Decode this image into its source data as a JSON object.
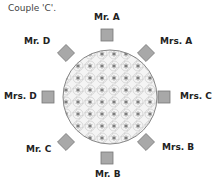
{
  "caption": "Couple 'C'.",
  "colors": {
    "seat_fill": "#a8a8a8",
    "seat_stroke": "#777777",
    "table_stroke": "#888888",
    "table_fill": "#f2f2f2"
  },
  "seats": [
    {
      "label": "Mr. A",
      "position": "top"
    },
    {
      "label": "Mrs. A",
      "position": "top-right"
    },
    {
      "label": "Mrs. C",
      "position": "right"
    },
    {
      "label": "Mrs. B",
      "position": "bottom-right"
    },
    {
      "label": "Mr. B",
      "position": "bottom"
    },
    {
      "label": "Mr. C",
      "position": "bottom-left"
    },
    {
      "label": "Mrs. D",
      "position": "left"
    },
    {
      "label": "Mr. D",
      "position": "top-left"
    }
  ]
}
